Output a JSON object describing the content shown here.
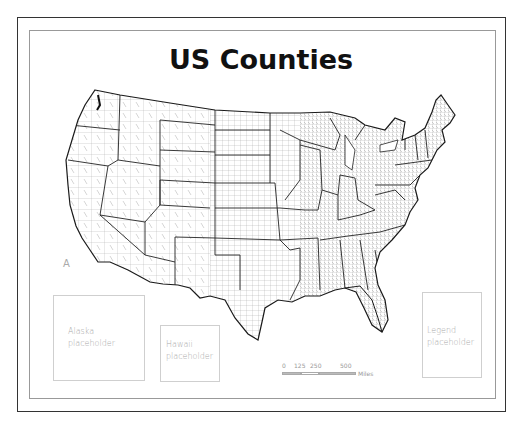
{
  "map": {
    "title": "US Counties",
    "north_arrow": "A",
    "placeholders": {
      "alaska": {
        "line1": "Alaska",
        "line2": "placeholder"
      },
      "hawaii": {
        "line1": "Hawaii",
        "line2": "placeholder"
      },
      "legend": {
        "line1": "Legend",
        "line2": "placeholder"
      }
    },
    "scale_bar": {
      "ticks": [
        "0",
        "125",
        "250",
        "500"
      ],
      "unit": "Miles"
    },
    "colors": {
      "frame": "#333333",
      "inner_frame": "#999999",
      "state_border": "#222222",
      "county_border": "#8a8a8a",
      "placeholder_text": "#aaaaaa"
    }
  }
}
